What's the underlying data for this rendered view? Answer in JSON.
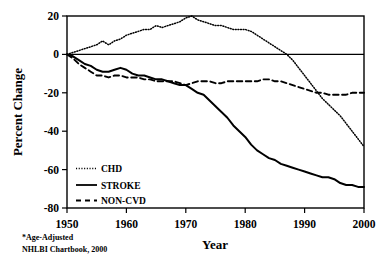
{
  "chart_data": {
    "type": "line",
    "title": "",
    "xlabel": "Year",
    "ylabel": "Percent Change",
    "xlim": [
      1950,
      2000
    ],
    "ylim": [
      -80,
      20
    ],
    "xticks": [
      1950,
      1960,
      1970,
      1980,
      1990,
      2000
    ],
    "xtick_labels": [
      "1950",
      "1960",
      "1970",
      "1980",
      "1990",
      "2000"
    ],
    "yticks": [
      20,
      0,
      -20,
      -40,
      -60,
      -80
    ],
    "ytick_labels": [
      "20",
      "0",
      "-20",
      "-40",
      "-60",
      "-80"
    ],
    "grid": false,
    "zero_line": true,
    "legend_position": "lower-left-inside",
    "series": [
      {
        "name": "CHD",
        "style": "dotted",
        "color": "#000000",
        "x": [
          1950,
          1951,
          1952,
          1953,
          1954,
          1955,
          1956,
          1957,
          1958,
          1959,
          1960,
          1961,
          1962,
          1963,
          1964,
          1965,
          1966,
          1967,
          1968,
          1969,
          1970,
          1971,
          1972,
          1973,
          1974,
          1975,
          1976,
          1977,
          1978,
          1979,
          1980,
          1981,
          1982,
          1983,
          1984,
          1985,
          1986,
          1987,
          1988,
          1989,
          1990,
          1991,
          1992,
          1993,
          1994,
          1995,
          1996,
          1997,
          1998,
          1999,
          2000
        ],
        "values": [
          0,
          1,
          2,
          3,
          4,
          5,
          7,
          5,
          7,
          8,
          10,
          11,
          12,
          13,
          13,
          15,
          14,
          15,
          16,
          17,
          19,
          20,
          18,
          17,
          16,
          15,
          15,
          14,
          13,
          13,
          13,
          12,
          10,
          8,
          6,
          4,
          2,
          0,
          -3,
          -7,
          -11,
          -15,
          -19,
          -23,
          -26,
          -29,
          -32,
          -36,
          -40,
          -44,
          -48
        ]
      },
      {
        "name": "STROKE",
        "style": "solid",
        "color": "#000000",
        "x": [
          1950,
          1951,
          1952,
          1953,
          1954,
          1955,
          1956,
          1957,
          1958,
          1959,
          1960,
          1961,
          1962,
          1963,
          1964,
          1965,
          1966,
          1967,
          1968,
          1969,
          1970,
          1971,
          1972,
          1973,
          1974,
          1975,
          1976,
          1977,
          1978,
          1979,
          1980,
          1981,
          1982,
          1983,
          1984,
          1985,
          1986,
          1987,
          1988,
          1989,
          1990,
          1991,
          1992,
          1993,
          1994,
          1995,
          1996,
          1997,
          1998,
          1999,
          2000
        ],
        "values": [
          0,
          -1,
          -3,
          -5,
          -6,
          -8,
          -9,
          -9,
          -8,
          -7,
          -8,
          -10,
          -11,
          -11,
          -12,
          -13,
          -13,
          -14,
          -15,
          -16,
          -16,
          -18,
          -20,
          -21,
          -24,
          -27,
          -30,
          -33,
          -37,
          -40,
          -43,
          -47,
          -50,
          -52,
          -54,
          -55,
          -57,
          -58,
          -59,
          -60,
          -61,
          -62,
          -63,
          -64,
          -64,
          -65,
          -67,
          -68,
          -68,
          -69,
          -69
        ]
      },
      {
        "name": "NON-CVD",
        "style": "dashed",
        "color": "#000000",
        "x": [
          1950,
          1951,
          1952,
          1953,
          1954,
          1955,
          1956,
          1957,
          1958,
          1959,
          1960,
          1961,
          1962,
          1963,
          1964,
          1965,
          1966,
          1967,
          1968,
          1969,
          1970,
          1971,
          1972,
          1973,
          1974,
          1975,
          1976,
          1977,
          1978,
          1979,
          1980,
          1981,
          1982,
          1983,
          1984,
          1985,
          1986,
          1987,
          1988,
          1989,
          1990,
          1991,
          1992,
          1993,
          1994,
          1995,
          1996,
          1997,
          1998,
          1999,
          2000
        ],
        "values": [
          0,
          -2,
          -5,
          -7,
          -9,
          -11,
          -11,
          -12,
          -11,
          -11,
          -12,
          -12,
          -12,
          -13,
          -13,
          -14,
          -14,
          -14,
          -14,
          -15,
          -16,
          -15,
          -14,
          -14,
          -14,
          -15,
          -15,
          -14,
          -14,
          -14,
          -14,
          -14,
          -14,
          -13,
          -13,
          -14,
          -14,
          -15,
          -16,
          -17,
          -18,
          -19,
          -20,
          -20,
          -21,
          -21,
          -21,
          -21,
          -20,
          -20,
          -20
        ]
      }
    ],
    "footnote_line1": "*Age-Adjusted",
    "footnote_line2": "NHLBI Chartbook, 2000"
  }
}
